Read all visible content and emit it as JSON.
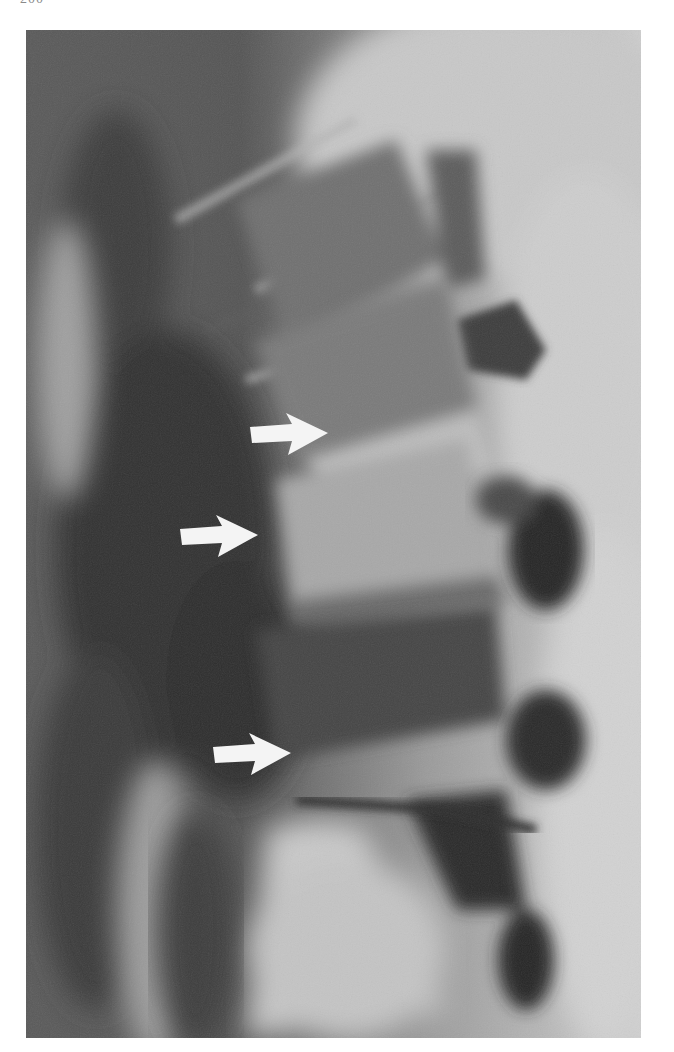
{
  "page": {
    "page_number": "200"
  },
  "figure": {
    "type": "radiograph",
    "colors": {
      "background": "#ffffff",
      "film_dark": "#2e2e2e",
      "film_mid": "#8c8c8c",
      "film_light": "#d8d8d8",
      "arrow_fill": "#f4f4f4"
    },
    "arrows": [
      {
        "name": "upper-arrow",
        "direction": "right",
        "x": 250,
        "y": 415
      },
      {
        "name": "middle-arrow",
        "direction": "right",
        "x": 180,
        "y": 517
      },
      {
        "name": "lower-arrow",
        "direction": "right",
        "x": 213,
        "y": 737
      }
    ]
  }
}
